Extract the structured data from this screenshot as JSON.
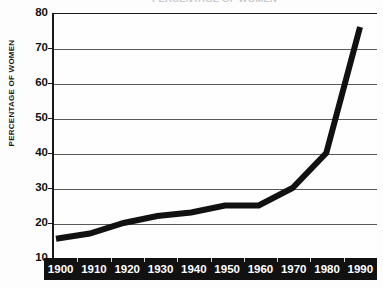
{
  "chart_data": {
    "type": "line",
    "title": "PERCENTAGE OF WOMEN",
    "subtitle": "",
    "xlabel": "",
    "ylabel": "PERCENTAGE OF WOMEN",
    "categories": [
      "1900",
      "1910",
      "1920",
      "1930",
      "1940",
      "1950",
      "1960",
      "1970",
      "1980",
      "1990"
    ],
    "x": [
      1900,
      1910,
      1920,
      1930,
      1940,
      1950,
      1960,
      1970,
      1980,
      1990
    ],
    "values": [
      15.5,
      17,
      20,
      22,
      23,
      25,
      25,
      30,
      40,
      76
    ],
    "series": [
      {
        "name": "Percentage of women",
        "values": [
          15.5,
          17,
          20,
          22,
          23,
          25,
          25,
          30,
          40,
          76
        ],
        "color": "#111111",
        "line_width": 6
      }
    ],
    "ylim": [
      10,
      80
    ],
    "xlim": [
      1900,
      1990
    ],
    "yticks": [
      10,
      20,
      30,
      40,
      50,
      60,
      70,
      80
    ],
    "ytick_labels": [
      "10",
      "20",
      "30",
      "40",
      "50",
      "60",
      "70",
      "80"
    ],
    "xticks": [
      1900,
      1910,
      1920,
      1930,
      1940,
      1950,
      1960,
      1970,
      1980,
      1990
    ],
    "xtick_labels": [
      "1900",
      "1910",
      "1920",
      "1930",
      "1940",
      "1950",
      "1960",
      "1970",
      "1980",
      "1990"
    ],
    "grid": true,
    "grid_axis": "y",
    "legend": false,
    "legend_position": "none",
    "annotations": []
  },
  "axes": {
    "y_caption": "PERCENTAGE OF WOMEN",
    "y_tick_labels": [
      "80",
      "70",
      "60",
      "50",
      "40",
      "30",
      "20",
      "10"
    ],
    "x_tick_labels": [
      "1900",
      "1910",
      "1920",
      "1930",
      "1940",
      "1950",
      "1960",
      "1970",
      "1980",
      "1990"
    ]
  },
  "colors": {
    "line": "#111111",
    "grid": "#595959",
    "frame": "#1a1a1a",
    "x_band_background": "#111111",
    "x_band_text": "#ffffff",
    "plot_background": "#fefefe",
    "title_text": "#c9c9cc"
  },
  "title": {
    "text": "PERCENTAGE OF WOMEN"
  }
}
